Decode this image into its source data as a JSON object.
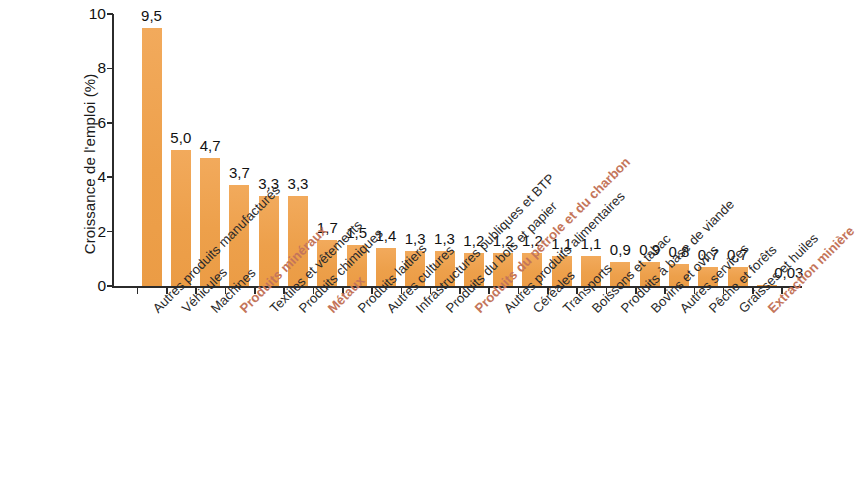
{
  "chart_data": {
    "type": "bar",
    "title": "",
    "xlabel": "",
    "ylabel": "Croissance de l'emploi (%)",
    "ylim": [
      0,
      10
    ],
    "yticks": [
      0,
      2,
      4,
      6,
      8,
      10
    ],
    "ytick_labels": [
      "0",
      "2",
      "4",
      "6",
      "8",
      "10"
    ],
    "grid": false,
    "legend": "none",
    "bar_color": "#f0a351",
    "highlight_color": "#c4755a",
    "label_color": "#2a2a2a",
    "decimal_separator": ",",
    "categories": [
      "Autres produits manufacturés",
      "Véhicules",
      "Machines",
      "Produits minéraux",
      "Textiles et vêtements",
      "Produits chimiques",
      "Métaux",
      "Produits laitiers",
      "Autres cultures",
      "Infrastructures publiques et BTP",
      "Produits du bois et papier",
      "Produits du pétrole et du charbon",
      "Autres produits alimentaires",
      "Céréales",
      "Transports",
      "Boissons et tabac",
      "Produits à base de viande",
      "Bovins et ovins",
      "Autres services",
      "Pêche et forêts",
      "Graisses et huiles",
      "Extraction minière"
    ],
    "values": [
      9.5,
      5.0,
      4.7,
      3.7,
      3.3,
      3.3,
      1.7,
      1.5,
      1.4,
      1.3,
      1.3,
      1.2,
      1.2,
      1.2,
      1.1,
      1.1,
      0.9,
      0.9,
      0.8,
      0.7,
      0.7,
      0.03
    ],
    "value_labels": [
      "9,5",
      "5,0",
      "4,7",
      "3,7",
      "3,3",
      "3,3",
      "1,7",
      "1,5",
      "1,4",
      "1,3",
      "1,3",
      "1,2",
      "1,2",
      "1,2",
      "1,1",
      "1,1",
      "0,9",
      "0,9",
      "0,8",
      "0,7",
      "0,7",
      "0,03"
    ],
    "highlighted": [
      false,
      false,
      false,
      true,
      false,
      false,
      true,
      false,
      false,
      false,
      false,
      true,
      false,
      false,
      false,
      false,
      false,
      false,
      false,
      false,
      false,
      true
    ]
  }
}
